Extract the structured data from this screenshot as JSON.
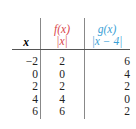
{
  "table": {
    "headers": {
      "x": "x",
      "f_name": "f(x)",
      "f_expr": "|x|",
      "g_name": "g(x)",
      "g_expr": "|x − 4|"
    },
    "colors": {
      "f": "#d9434a",
      "g": "#3a9fd6"
    },
    "rows": [
      {
        "x": "−2",
        "f": "2",
        "g": "6"
      },
      {
        "x": "0",
        "f": "0",
        "g": "4"
      },
      {
        "x": "2",
        "f": "2",
        "g": "2"
      },
      {
        "x": "4",
        "f": "4",
        "g": "0"
      },
      {
        "x": "6",
        "f": "6",
        "g": "2"
      }
    ]
  }
}
